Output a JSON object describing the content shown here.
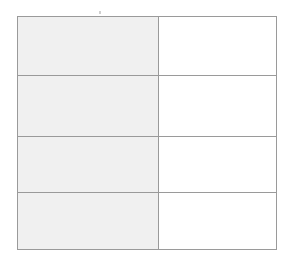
{
  "page": {
    "background_color": "#ffffff",
    "width": 292,
    "height": 266
  },
  "artifact": {
    "name": "speck-mark",
    "label": "",
    "color": "#c8c8c8"
  },
  "table": {
    "name": "two-column-table",
    "border_color": "#9a9a9a",
    "label_column_fill": "#f0f0f0",
    "value_column_fill": "#ffffff",
    "row_count": 4,
    "column_count": 2,
    "columns": [
      {
        "key": "label",
        "header": "",
        "fill": "#f0f0f0"
      },
      {
        "key": "value",
        "header": "",
        "fill": "#ffffff"
      }
    ],
    "rows": [
      {
        "label": "",
        "value": ""
      },
      {
        "label": "",
        "value": ""
      },
      {
        "label": "",
        "value": ""
      },
      {
        "label": "",
        "value": ""
      }
    ]
  }
}
